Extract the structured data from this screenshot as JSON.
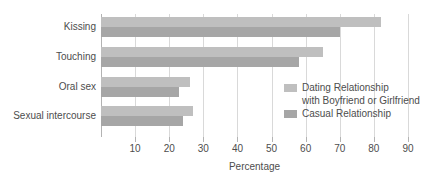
{
  "chart_data": {
    "type": "bar",
    "orientation": "horizontal",
    "title": "",
    "xlabel": "Percentage",
    "ylabel": "",
    "categories": [
      "Kissing",
      "Touching",
      "Oral sex",
      "Sexual intercourse"
    ],
    "series": [
      {
        "name": "Dating Relationship with Boyfriend or Girlfriend",
        "color": "#bfbfbf",
        "values": [
          82,
          65,
          26,
          27
        ]
      },
      {
        "name": "Casual Relationship",
        "color": "#a6a6a6",
        "values": [
          70,
          58,
          23,
          24
        ]
      }
    ],
    "xlim": [
      0,
      90
    ],
    "xticks": [
      10,
      20,
      30,
      40,
      50,
      60,
      70,
      80,
      90
    ],
    "xtick_labels": [
      "10",
      "20",
      "30",
      "40",
      "50",
      "60",
      "70",
      "80",
      "90"
    ],
    "grid": true,
    "legend_position": "inside-right"
  },
  "axis": {
    "x_title": "Percentage",
    "ticks": [
      "10",
      "20",
      "30",
      "40",
      "50",
      "60",
      "70",
      "80",
      "90"
    ]
  },
  "categories": [
    {
      "label": "Kissing"
    },
    {
      "label": "Touching"
    },
    {
      "label": "Oral sex"
    },
    {
      "label": "Sexual intercourse"
    }
  ],
  "legend": {
    "dating_line1": "Dating Relationship",
    "dating_line2": "with Boyfriend or Girlfriend",
    "casual": "Casual Relationship"
  },
  "colors": {
    "dating": "#bfbfbf",
    "casual": "#a6a6a6",
    "gridline": "#d9d9d9",
    "axis": "#b3b3b3",
    "text": "#4d4d4d",
    "background": "#ffffff"
  }
}
